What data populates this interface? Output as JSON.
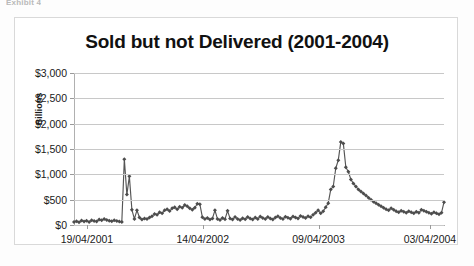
{
  "page": {
    "top_crumb": "Exhibit 4"
  },
  "chart_data": {
    "type": "line",
    "title": "Sold but not Delivered (2001-2004)",
    "xlabel": "",
    "ylabel": "Billions",
    "ylim": [
      0,
      3000
    ],
    "ytick_labels": [
      "$3,000",
      "$2,500",
      "$2,000",
      "$1,500",
      "$1,000",
      "$500",
      "$0"
    ],
    "ytick_values": [
      3000,
      2500,
      2000,
      1500,
      1000,
      500,
      0
    ],
    "xtick_labels": [
      "19/04/2001",
      "14/04/2002",
      "09/04/2003",
      "03/04/2004"
    ],
    "xtick_positions": [
      0.035,
      0.348,
      0.661,
      0.962
    ],
    "grid": "horizontal",
    "legend": "none",
    "marker": "diamond",
    "line_color": "#555555",
    "marker_color": "#4d4d4d",
    "series": [
      {
        "name": "Sold but not Delivered",
        "values": [
          60,
          75,
          55,
          90,
          70,
          85,
          60,
          95,
          80,
          70,
          110,
          95,
          120,
          100,
          85,
          75,
          95,
          80,
          70,
          60,
          1300,
          600,
          960,
          300,
          120,
          290,
          150,
          110,
          130,
          120,
          150,
          175,
          215,
          200,
          250,
          230,
          290,
          310,
          275,
          330,
          350,
          310,
          360,
          340,
          395,
          370,
          330,
          300,
          340,
          420,
          410,
          155,
          120,
          140,
          110,
          130,
          290,
          120,
          100,
          140,
          115,
          280,
          130,
          110,
          160,
          120,
          100,
          135,
          115,
          160,
          130,
          110,
          150,
          120,
          170,
          140,
          120,
          160,
          130,
          110,
          150,
          175,
          140,
          120,
          165,
          145,
          125,
          170,
          150,
          130,
          180,
          160,
          140,
          175,
          155,
          200,
          240,
          290,
          230,
          270,
          350,
          430,
          700,
          760,
          1120,
          1280,
          1640,
          1610,
          1140,
          1050,
          900,
          820,
          760,
          700,
          660,
          620,
          580,
          540,
          500,
          460,
          430,
          400,
          370,
          340,
          310,
          290,
          330,
          300,
          270,
          250,
          280,
          260,
          240,
          270,
          250,
          230,
          260,
          240,
          300,
          280,
          260,
          240,
          220,
          250,
          230,
          210,
          240,
          450
        ]
      }
    ]
  }
}
